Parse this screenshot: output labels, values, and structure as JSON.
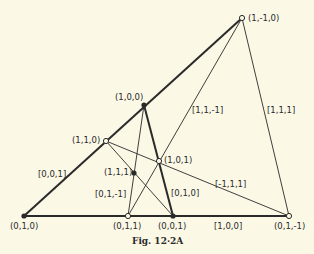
{
  "caption": "Fig. 12·2A",
  "points": {
    "p_1m10": {
      "label": "(1,-1,0)",
      "x": 242,
      "y": 18,
      "filled": false
    },
    "p_100": {
      "label": "(1,0,0)",
      "x": 144,
      "y": 105,
      "filled": true
    },
    "p_110": {
      "label": "(1,1,0)",
      "x": 106,
      "y": 141,
      "filled": false
    },
    "p_101": {
      "label": "(1,0,1)",
      "x": 159,
      "y": 161,
      "filled": false
    },
    "p_111": {
      "label": "(1,1,1)",
      "x": 134,
      "y": 173,
      "filled": true
    },
    "p_010": {
      "label": "(0,1,0)",
      "x": 24,
      "y": 216,
      "filled": true
    },
    "p_011": {
      "label": "(0,1,1)",
      "x": 128,
      "y": 216,
      "filled": false
    },
    "p_001": {
      "label": "(0,0,1)",
      "x": 173,
      "y": 216,
      "filled": true
    },
    "p_01m1": {
      "label": "(0,1,-1)",
      "x": 289,
      "y": 216,
      "filled": false
    }
  },
  "line_labels": {
    "l_001": "[0,0,1]",
    "l_11m1": "[1,1,-1]",
    "l_111": "[1,1,1]",
    "l_m111": "[-1,1,1]",
    "l_01m1": "[0,1,-1]",
    "l_010": "[0,1,0]",
    "l_100": "[1,0,0]"
  },
  "colors": {
    "background": "#fbf8e6",
    "ink": "#2a2a2a"
  }
}
